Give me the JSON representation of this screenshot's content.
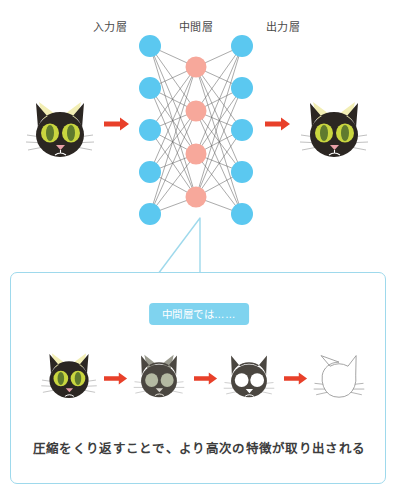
{
  "diagram": {
    "labels": {
      "input_layer": "入力層",
      "hidden_layer": "中間層",
      "output_layer": "出力層"
    },
    "network": {
      "input_nodes": 5,
      "hidden_nodes": 4,
      "output_nodes": 5,
      "input_node_color": "#5bc8f0",
      "hidden_node_color": "#f7a89b",
      "edge_color": "#555555"
    },
    "arrows": {
      "color": "#e8402a",
      "top_left_name": "arrow-input-to-network",
      "top_right_name": "arrow-network-to-output"
    },
    "cats": {
      "body_color": "#2b2622",
      "ear_inner_color": "#f2eeb4",
      "eye_color": "#c9d63f",
      "pupil_color": "#5f7a2e",
      "nose_color": "#e8a0a8",
      "whisker_color": "#999999"
    }
  },
  "callout": {
    "badge_label": "中間層では……",
    "badge_bg": "#7fd3ef",
    "border_color": "#9ed9ec",
    "caption": "圧縮をくり返すことで、より高次の特徴が取り出される",
    "steps": [
      {
        "name": "cat-full-detail",
        "stage": "1"
      },
      {
        "name": "cat-desaturated",
        "stage": "2"
      },
      {
        "name": "cat-silhouette",
        "stage": "3"
      },
      {
        "name": "cat-outline",
        "stage": "4"
      }
    ]
  }
}
